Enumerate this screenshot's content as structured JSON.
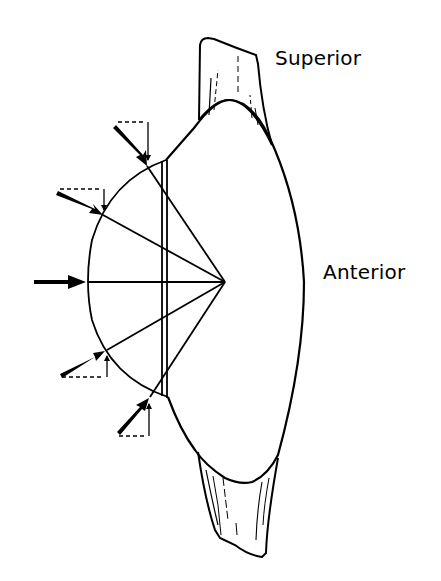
{
  "diagram": {
    "type": "anatomical-force-diagram",
    "labels": {
      "superior": "Superior",
      "anterior": "Anterior"
    },
    "colors": {
      "stroke": "#000000",
      "background": "#ffffff"
    },
    "focal_point": {
      "x": 225,
      "y": 282
    },
    "arc": {
      "top": {
        "x": 147,
        "y": 166
      },
      "left": {
        "x": 88,
        "y": 282
      },
      "bottom": {
        "x": 150,
        "y": 397
      }
    },
    "force_arrows": [
      {
        "id": "upper-1",
        "at": {
          "x": 147,
          "y": 166
        },
        "direction": "down-right",
        "with_components": true
      },
      {
        "id": "upper-2",
        "at": {
          "x": 103,
          "y": 215
        },
        "direction": "down-right",
        "with_components": true
      },
      {
        "id": "center",
        "at": {
          "x": 88,
          "y": 282
        },
        "direction": "right",
        "with_components": false
      },
      {
        "id": "lower-2",
        "at": {
          "x": 107,
          "y": 350
        },
        "direction": "up-right",
        "with_components": true
      },
      {
        "id": "lower-1",
        "at": {
          "x": 150,
          "y": 397
        },
        "direction": "up-right",
        "with_components": true
      }
    ]
  }
}
